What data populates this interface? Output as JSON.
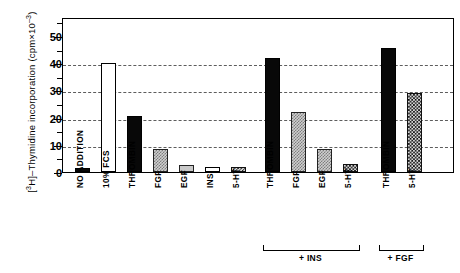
{
  "figure": {
    "ylabel_prefix": "[",
    "ylabel_h": "3H",
    "ylabel_main": "]–Thymidine incorporation (cpm×10",
    "ylabel_exp": "–3",
    "ylabel_suffix": ")",
    "ylabel_plain": "[3H]-Thymidine incorporation (cpm x 10-3)"
  },
  "axis": {
    "y_ticks": [
      "0",
      "10",
      "20",
      "30",
      "40",
      "50"
    ],
    "y_min": 0,
    "y_max": 57,
    "gridlines": [
      10,
      20,
      30,
      40
    ]
  },
  "groups": [
    {
      "label": "",
      "bracket": false
    },
    {
      "label": "+ INS",
      "bracket": true
    },
    {
      "label": "+ FGF",
      "bracket": true
    }
  ],
  "chart_data": {
    "type": "bar",
    "title": "",
    "xlabel": "",
    "ylabel": "[3H]-Thymidine incorporation (cpm x 10-3)",
    "ylim": [
      0,
      57
    ],
    "yticks": [
      0,
      10,
      20,
      30,
      40,
      50
    ],
    "grid": true,
    "gridlines_at": [
      10,
      20,
      30,
      40
    ],
    "legend": "none",
    "categories": [
      "NO ADDITION",
      "10% FCS",
      "THROMBIN",
      "FGF",
      "EGF",
      "INS",
      "5-HT",
      "THROMBIN",
      "FGF",
      "EGF",
      "5-HT",
      "THROMBIN",
      "5-HT"
    ],
    "values": [
      1.0,
      40.0,
      20.5,
      8.5,
      2.5,
      2.0,
      1.8,
      42.0,
      22.0,
      8.5,
      3.0,
      45.5,
      29.0
    ],
    "fills": [
      "black",
      "white",
      "black",
      "checker",
      "lightgray",
      "white",
      "dark-hatch",
      "black",
      "checker",
      "checker",
      "dark-hatch",
      "black",
      "dark-hatch"
    ],
    "group_of": [
      0,
      0,
      0,
      0,
      0,
      0,
      0,
      1,
      1,
      1,
      1,
      2,
      2
    ],
    "group_labels": [
      "",
      "+ INS",
      "+ FGF"
    ],
    "bars": [
      {
        "label": "NO ADDITION",
        "value": 1.0,
        "fill": "black",
        "group": ""
      },
      {
        "label": "10% FCS",
        "value": 40.0,
        "fill": "white",
        "group": ""
      },
      {
        "label": "THROMBIN",
        "value": 20.5,
        "fill": "black",
        "group": ""
      },
      {
        "label": "FGF",
        "value": 8.5,
        "fill": "checker",
        "group": ""
      },
      {
        "label": "EGF",
        "value": 2.5,
        "fill": "lightgray",
        "group": ""
      },
      {
        "label": "INS",
        "value": 2.0,
        "fill": "white",
        "group": ""
      },
      {
        "label": "5-HT",
        "value": 1.8,
        "fill": "dark-hatch",
        "group": ""
      },
      {
        "label": "THROMBIN",
        "value": 42.0,
        "fill": "black",
        "group": "+ INS"
      },
      {
        "label": "FGF",
        "value": 22.0,
        "fill": "checker",
        "group": "+ INS"
      },
      {
        "label": "EGF",
        "value": 8.5,
        "fill": "checker",
        "group": "+ INS"
      },
      {
        "label": "5-HT",
        "value": 3.0,
        "fill": "dark-hatch",
        "group": "+ INS"
      },
      {
        "label": "THROMBIN",
        "value": 45.5,
        "fill": "black",
        "group": "+ FGF"
      },
      {
        "label": "5-HT",
        "value": 29.0,
        "fill": "dark-hatch",
        "group": "+ FGF"
      }
    ]
  }
}
